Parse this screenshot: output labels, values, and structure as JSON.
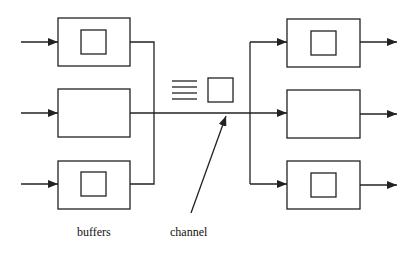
{
  "diagram": {
    "type": "buffered-channel-multiplexing",
    "labels": {
      "buffers": "buffers",
      "channel": "channel"
    },
    "colors": {
      "stroke": "#222222",
      "background": "#ffffff"
    },
    "left_nodes": [
      {
        "id": "input-buffer-1",
        "has_buffer": true
      },
      {
        "id": "input-buffer-2",
        "has_buffer": false
      },
      {
        "id": "input-buffer-3",
        "has_buffer": true
      }
    ],
    "right_nodes": [
      {
        "id": "output-buffer-1",
        "has_buffer": true
      },
      {
        "id": "output-buffer-2",
        "has_buffer": false
      },
      {
        "id": "output-buffer-3",
        "has_buffer": true
      }
    ],
    "channel_contents": {
      "queued_lines": 4,
      "packet": true
    }
  }
}
